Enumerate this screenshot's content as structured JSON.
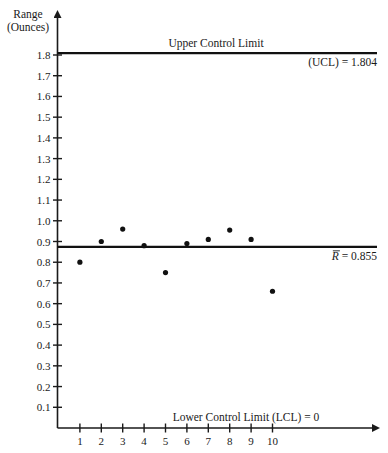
{
  "chart_data": {
    "type": "scatter",
    "title": "",
    "ylabel": [
      "Range",
      "(Ounces)"
    ],
    "xlabel": "",
    "x": [
      1,
      2,
      3,
      4,
      5,
      6,
      7,
      8,
      9,
      10
    ],
    "xticks": [
      "1",
      "2",
      "3",
      "4",
      "5",
      "6",
      "7",
      "8",
      "9",
      "10"
    ],
    "y": [
      0.8,
      0.9,
      0.96,
      0.88,
      0.75,
      0.89,
      0.91,
      0.955,
      0.91,
      0.66
    ],
    "yticks": [
      "0.1",
      "0.2",
      "0.3",
      "0.4",
      "0.5",
      "0.6",
      "0.7",
      "0.8",
      "0.9",
      "1.0",
      "1.1",
      "1.2",
      "1.3",
      "1.4",
      "1.5",
      "1.6",
      "1.7",
      "1.8"
    ],
    "ytick_values": [
      0.1,
      0.2,
      0.3,
      0.4,
      0.5,
      0.6,
      0.7,
      0.8,
      0.9,
      1.0,
      1.1,
      1.2,
      1.3,
      1.4,
      1.5,
      1.6,
      1.7,
      1.8
    ],
    "ylim": [
      0,
      1.8
    ],
    "xlim": [
      0,
      14
    ],
    "grid": false,
    "legend": "none",
    "reference_lines": [
      {
        "name": "ucl",
        "value": 1.804,
        "label_above": "Upper Control Limit",
        "label_below": "(UCL) = 1.804"
      },
      {
        "name": "r-bar",
        "value": 0.855,
        "label_symbol": "R",
        "label_rest": " = 0.855"
      },
      {
        "name": "lcl",
        "value": 0,
        "label_above": "Lower Control Limit (LCL) = 0"
      }
    ]
  }
}
